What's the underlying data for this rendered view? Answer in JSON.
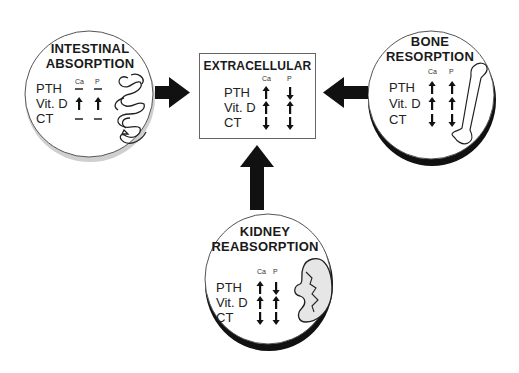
{
  "diagram": {
    "center": {
      "title": "EXTRACELLULAR",
      "columns": [
        "Ca",
        "P"
      ],
      "rows": [
        {
          "label": "PTH",
          "ca": "up",
          "p": "down"
        },
        {
          "label": "Vit. D",
          "ca": "up",
          "p": "up"
        },
        {
          "label": "CT",
          "ca": "down",
          "p": "down"
        }
      ]
    },
    "intestinal": {
      "title_line1": "INTESTINAL",
      "title_line2": "ABSORPTION",
      "columns": [
        "Ca",
        "P"
      ],
      "rows": [
        {
          "label": "PTH",
          "ca": "none",
          "p": "none"
        },
        {
          "label": "Vit. D",
          "ca": "up",
          "p": "up"
        },
        {
          "label": "CT",
          "ca": "none",
          "p": "none"
        }
      ],
      "illustration": "intestine-icon"
    },
    "bone": {
      "title_line1": "BONE",
      "title_line2": "RESORPTION",
      "columns": [
        "Ca",
        "P"
      ],
      "rows": [
        {
          "label": "PTH",
          "ca": "up",
          "p": "up"
        },
        {
          "label": "Vit. D",
          "ca": "up",
          "p": "up"
        },
        {
          "label": "CT",
          "ca": "down",
          "p": "down"
        }
      ],
      "illustration": "bone-icon"
    },
    "kidney": {
      "title_line1": "KIDNEY",
      "title_line2": "REABSORPTION",
      "columns": [
        "Ca",
        "P"
      ],
      "rows": [
        {
          "label": "PTH",
          "ca": "up",
          "p": "down"
        },
        {
          "label": "Vit. D",
          "ca": "up",
          "p": "up"
        },
        {
          "label": "CT",
          "ca": "down",
          "p": "down"
        }
      ],
      "illustration": "kidney-icon"
    },
    "flows": [
      {
        "from": "intestinal",
        "to": "center",
        "direction": "right"
      },
      {
        "from": "bone",
        "to": "center",
        "direction": "left"
      },
      {
        "from": "kidney",
        "to": "center",
        "direction": "up"
      }
    ]
  }
}
